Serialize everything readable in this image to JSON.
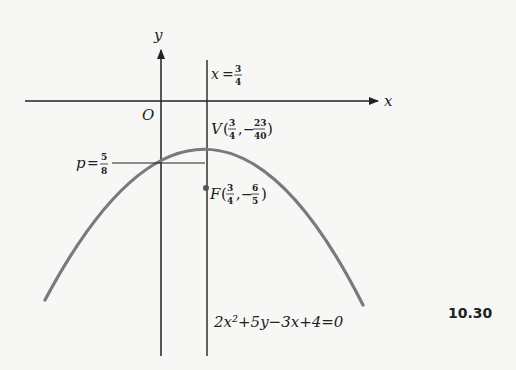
{
  "figure": {
    "number": "10.30",
    "axes": {
      "x_label": "x",
      "y_label": "y",
      "origin_label": "O"
    },
    "line_label": {
      "var": "x",
      "eq": "=",
      "num": "3",
      "den": "4"
    },
    "vertex": {
      "name": "V",
      "x_num": "3",
      "x_den": "4",
      "y_sign": "−",
      "y_num": "23",
      "y_den": "40"
    },
    "focus": {
      "name": "F",
      "x_num": "3",
      "x_den": "4",
      "y_sign": "−",
      "y_num": "6",
      "y_den": "5"
    },
    "p_label": {
      "var": "p",
      "eq": "=",
      "num": "5",
      "den": "8"
    },
    "equation": "2x²+5y−3x+4=0",
    "colors": {
      "curve": "#7a7a7a",
      "axes": "#222222",
      "background": "#f7f7f5"
    }
  }
}
